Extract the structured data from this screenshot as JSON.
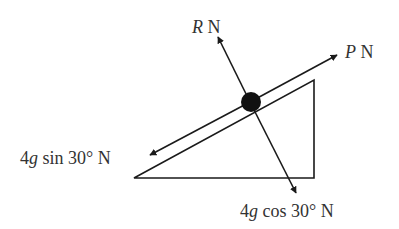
{
  "diagram": {
    "type": "force-diagram-inclined-plane",
    "colors": {
      "stroke": "#1a1a1a",
      "text": "#333333",
      "background": "#ffffff"
    },
    "labels": {
      "normal": {
        "symbol": "R",
        "unit": " N"
      },
      "applied": {
        "symbol": "P",
        "unit": " N"
      },
      "down_slope": {
        "coef": "4",
        "g": "g",
        "rest": " sin 30° N"
      },
      "perpendicular": {
        "coef": "4",
        "g": "g",
        "rest": " cos 30° N"
      }
    },
    "incline_angle_deg": 30
  }
}
